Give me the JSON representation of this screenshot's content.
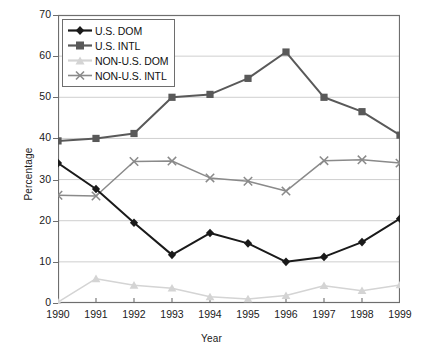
{
  "chart_data": {
    "type": "line",
    "title": "",
    "xlabel": "Year",
    "ylabel": "Percentage",
    "categories": [
      "1990",
      "1991",
      "1992",
      "1993",
      "1994",
      "1995",
      "1996",
      "1997",
      "1998",
      "1999"
    ],
    "x": [
      1990,
      1991,
      1992,
      1993,
      1994,
      1995,
      1996,
      1997,
      1998,
      1999
    ],
    "xlim": [
      1990,
      1999
    ],
    "ylim": [
      0,
      70
    ],
    "yticks": [
      0,
      10,
      20,
      30,
      40,
      50,
      60,
      70
    ],
    "grid": "horizontal",
    "legend_position": "top-left-inside",
    "series": [
      {
        "name": "U.S. DOM",
        "color": "#1a1a1a",
        "marker": "diamond",
        "values": [
          34.0,
          27.7,
          19.5,
          11.7,
          17.0,
          14.5,
          10.0,
          11.2,
          14.8,
          20.5
        ]
      },
      {
        "name": "U.S. INTL",
        "color": "#595959",
        "marker": "square",
        "values": [
          39.4,
          40.0,
          41.2,
          50.0,
          50.7,
          54.6,
          61.0,
          50.0,
          46.5,
          40.8
        ]
      },
      {
        "name": "NON-U.S. DOM",
        "color": "#d4d4d4",
        "marker": "triangle",
        "values": [
          0.2,
          5.9,
          4.3,
          3.6,
          1.5,
          1.0,
          1.8,
          4.2,
          3.0,
          4.4
        ]
      },
      {
        "name": "NON-U.S. INTL",
        "color": "#8a8a8a",
        "marker": "x",
        "values": [
          26.2,
          26.0,
          34.4,
          34.5,
          30.4,
          29.6,
          27.2,
          34.6,
          34.8,
          34.0
        ]
      }
    ]
  },
  "legend": {
    "items": [
      {
        "label": "U.S. DOM"
      },
      {
        "label": "U.S. INTL"
      },
      {
        "label": "NON-U.S. DOM"
      },
      {
        "label": "NON-U.S. INTL"
      }
    ]
  },
  "axes": {
    "y_title": "Percentage",
    "x_title": "Year"
  }
}
